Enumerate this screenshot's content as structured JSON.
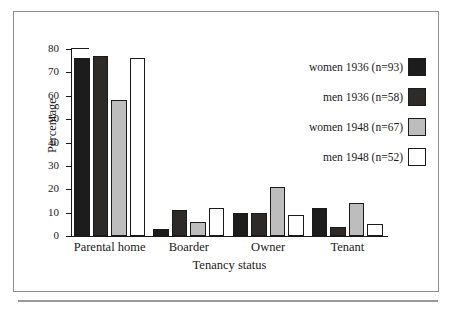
{
  "chart_data": {
    "type": "bar",
    "title": "",
    "xlabel": "Tenancy status",
    "ylabel": "Percentage",
    "ylim": [
      0,
      80
    ],
    "yticks": [
      0,
      10,
      20,
      30,
      40,
      50,
      60,
      70,
      80
    ],
    "ytick_labels": [
      "0",
      "10",
      "20",
      "30",
      "40",
      "50",
      "60",
      "70",
      "80"
    ],
    "grid": false,
    "legend_position": "upper right",
    "categories": [
      "Parental home",
      "Boarder",
      "Owner",
      "Tenant"
    ],
    "series": [
      {
        "name": "women 1936 (n=93)",
        "color": "#1c1c1c",
        "values": [
          76,
          3,
          10,
          12
        ]
      },
      {
        "name": "men 1936 (n=58)",
        "color": "#2e2a28",
        "values": [
          77,
          11,
          10,
          4
        ]
      },
      {
        "name": "women 1948 (n=67)",
        "color": "#bdbdbd",
        "values": [
          58,
          6,
          21,
          14
        ]
      },
      {
        "name": "men 1948 (n=52)",
        "color": "#ffffff",
        "values": [
          76,
          12,
          9,
          5
        ]
      }
    ]
  },
  "colors": {
    "axis": "#1a1a1a",
    "frame": "#8e8e8e",
    "rule": "#9a9a9a",
    "background": "#ffffff"
  }
}
